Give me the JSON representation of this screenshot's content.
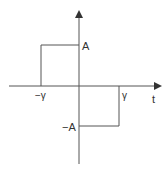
{
  "diagram": {
    "type": "signal-waveform",
    "axes": {
      "horizontal_label": "t",
      "vertical_label": ""
    },
    "labels": {
      "amp_pos": "A",
      "amp_neg": "−A",
      "time_neg": "−γ",
      "time_pos": "γ",
      "t_axis": "t"
    },
    "segments": [
      {
        "from": "−γ",
        "to": "0",
        "value": "A"
      },
      {
        "from": "0",
        "to": "γ",
        "value": "−A"
      }
    ],
    "colors": {
      "line": "#555555",
      "text": "#333333"
    }
  }
}
